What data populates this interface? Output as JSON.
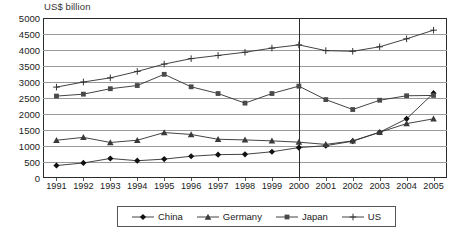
{
  "chart_data": {
    "type": "line",
    "title": "US$ billion",
    "xlabel": "",
    "ylabel": "US$ billion",
    "ylim": [
      0,
      5000
    ],
    "ytick_step": 500,
    "yticks": [
      5000,
      4500,
      4000,
      3500,
      3000,
      2500,
      2000,
      1500,
      1000,
      500,
      0
    ],
    "grid": true,
    "grid_axis": "y",
    "legend_position": "bottom",
    "categories": [
      1991,
      1992,
      1993,
      1994,
      1995,
      1996,
      1997,
      1998,
      1999,
      2000,
      2001,
      2002,
      2003,
      2004,
      2005
    ],
    "x_tick_labels": [
      "1991",
      "1992",
      "1993",
      "1994",
      "1995",
      "1996",
      "1997",
      "1998",
      "1999",
      "2000",
      "2001",
      "2002",
      "2003",
      "2004",
      "2005"
    ],
    "annotations": [
      {
        "type": "vertical-line",
        "x": 2000,
        "label": ""
      }
    ],
    "series": [
      {
        "name": "China",
        "marker": "diamond",
        "values": [
          390,
          470,
          610,
          540,
          590,
          680,
          730,
          740,
          820,
          950,
          1010,
          1150,
          1430,
          1850,
          2650
        ]
      },
      {
        "name": "Germany",
        "marker": "triangle",
        "values": [
          1180,
          1270,
          1110,
          1180,
          1420,
          1360,
          1210,
          1190,
          1160,
          1120,
          1050,
          1160,
          1430,
          1700,
          1850
        ]
      },
      {
        "name": "Japan",
        "marker": "square",
        "values": [
          2560,
          2620,
          2790,
          2890,
          3240,
          2850,
          2640,
          2340,
          2640,
          2870,
          2450,
          2140,
          2430,
          2570,
          2580
        ]
      },
      {
        "name": "US",
        "marker": "plus",
        "values": [
          2840,
          3000,
          3130,
          3330,
          3560,
          3730,
          3830,
          3930,
          4060,
          4160,
          3980,
          3960,
          4100,
          4350,
          4620
        ]
      }
    ]
  },
  "legend": {
    "items": [
      {
        "label": "China",
        "marker": "diamond"
      },
      {
        "label": "Germany",
        "marker": "triangle"
      },
      {
        "label": "Japan",
        "marker": "square"
      },
      {
        "label": "US",
        "marker": "plus"
      }
    ]
  }
}
